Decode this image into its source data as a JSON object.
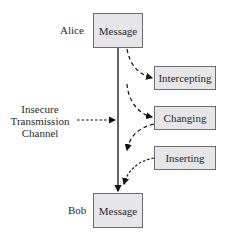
{
  "diagram": {
    "sender": {
      "name": "Alice",
      "box_label": "Message"
    },
    "receiver": {
      "name": "Bob",
      "box_label": "Message"
    },
    "channel_label": [
      "Insecure",
      "Transmission",
      "Channel"
    ],
    "attacks": [
      {
        "label": "Intercepting"
      },
      {
        "label": "Changing"
      },
      {
        "label": "Inserting"
      }
    ],
    "colors": {
      "box_fill": "#e6e6e9",
      "box_border": "#6e6e72",
      "line": "#111111"
    }
  }
}
